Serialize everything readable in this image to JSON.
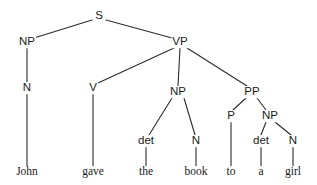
{
  "diagram": {
    "sentence": "John gave the book to a girl",
    "type": "constituency-parse-tree",
    "background_color": "#ffffff",
    "line_color": "#2b2b2b",
    "text_color": "#1a1a1a",
    "nodes": [
      {
        "id": "s",
        "label": "S",
        "kind": "nonterminal",
        "x": 99,
        "y": 16
      },
      {
        "id": "np1",
        "label": "NP",
        "kind": "nonterminal",
        "x": 27,
        "y": 42
      },
      {
        "id": "vp",
        "label": "VP",
        "kind": "nonterminal",
        "x": 180,
        "y": 42
      },
      {
        "id": "n1",
        "label": "N",
        "kind": "nonterminal",
        "x": 27,
        "y": 88
      },
      {
        "id": "v",
        "label": "V",
        "kind": "nonterminal",
        "x": 93,
        "y": 88
      },
      {
        "id": "np2",
        "label": "NP",
        "kind": "nonterminal",
        "x": 178,
        "y": 92
      },
      {
        "id": "pp",
        "label": "PP",
        "kind": "nonterminal",
        "x": 252,
        "y": 92
      },
      {
        "id": "det1",
        "label": "det",
        "kind": "nonterminal",
        "x": 146,
        "y": 141
      },
      {
        "id": "n2",
        "label": "N",
        "kind": "nonterminal",
        "x": 196,
        "y": 141
      },
      {
        "id": "p",
        "label": "P",
        "kind": "nonterminal",
        "x": 231,
        "y": 116
      },
      {
        "id": "np3",
        "label": "NP",
        "kind": "nonterminal",
        "x": 270,
        "y": 116
      },
      {
        "id": "det2",
        "label": "det",
        "kind": "nonterminal",
        "x": 261,
        "y": 141
      },
      {
        "id": "n3",
        "label": "N",
        "kind": "nonterminal",
        "x": 293,
        "y": 141
      },
      {
        "id": "w_john",
        "label": "John",
        "kind": "terminal",
        "x": 27,
        "y": 172
      },
      {
        "id": "w_gave",
        "label": "gave",
        "kind": "terminal",
        "x": 93,
        "y": 172
      },
      {
        "id": "w_the",
        "label": "the",
        "kind": "terminal",
        "x": 146,
        "y": 172
      },
      {
        "id": "w_book",
        "label": "book",
        "kind": "terminal",
        "x": 196,
        "y": 172
      },
      {
        "id": "w_to",
        "label": "to",
        "kind": "terminal",
        "x": 231,
        "y": 172
      },
      {
        "id": "w_a",
        "label": "a",
        "kind": "terminal",
        "x": 261,
        "y": 172
      },
      {
        "id": "w_girl",
        "label": "girl",
        "kind": "terminal",
        "x": 293,
        "y": 172
      }
    ],
    "edges": [
      {
        "from": "s",
        "to": "np1",
        "x1": 92,
        "y1": 20,
        "x2": 34,
        "y2": 38
      },
      {
        "from": "s",
        "to": "vp",
        "x1": 106,
        "y1": 20,
        "x2": 172,
        "y2": 38
      },
      {
        "from": "np1",
        "to": "n1",
        "x1": 27,
        "y1": 48,
        "x2": 27,
        "y2": 82
      },
      {
        "from": "n1",
        "to": "w_john",
        "x1": 27,
        "y1": 94,
        "x2": 27,
        "y2": 166
      },
      {
        "from": "vp",
        "to": "v",
        "x1": 174,
        "y1": 48,
        "x2": 98,
        "y2": 83
      },
      {
        "from": "vp",
        "to": "np2",
        "x1": 180,
        "y1": 48,
        "x2": 178,
        "y2": 86
      },
      {
        "from": "vp",
        "to": "pp",
        "x1": 187,
        "y1": 48,
        "x2": 247,
        "y2": 86
      },
      {
        "from": "v",
        "to": "w_gave",
        "x1": 93,
        "y1": 94,
        "x2": 93,
        "y2": 166
      },
      {
        "from": "np2",
        "to": "det1",
        "x1": 172,
        "y1": 98,
        "x2": 149,
        "y2": 135
      },
      {
        "from": "np2",
        "to": "n2",
        "x1": 184,
        "y1": 98,
        "x2": 195,
        "y2": 135
      },
      {
        "from": "det1",
        "to": "w_the",
        "x1": 146,
        "y1": 147,
        "x2": 146,
        "y2": 166
      },
      {
        "from": "n2",
        "to": "w_book",
        "x1": 196,
        "y1": 147,
        "x2": 196,
        "y2": 166
      },
      {
        "from": "pp",
        "to": "p",
        "x1": 246,
        "y1": 98,
        "x2": 233,
        "y2": 110
      },
      {
        "from": "pp",
        "to": "np3",
        "x1": 257,
        "y1": 98,
        "x2": 266,
        "y2": 110
      },
      {
        "from": "p",
        "to": "w_to",
        "x1": 231,
        "y1": 122,
        "x2": 231,
        "y2": 166
      },
      {
        "from": "np3",
        "to": "det2",
        "x1": 266,
        "y1": 122,
        "x2": 261,
        "y2": 135
      },
      {
        "from": "np3",
        "to": "n3",
        "x1": 275,
        "y1": 122,
        "x2": 291,
        "y2": 135
      },
      {
        "from": "det2",
        "to": "w_a",
        "x1": 261,
        "y1": 147,
        "x2": 261,
        "y2": 166
      },
      {
        "from": "n3",
        "to": "w_girl",
        "x1": 293,
        "y1": 147,
        "x2": 293,
        "y2": 166
      }
    ]
  }
}
